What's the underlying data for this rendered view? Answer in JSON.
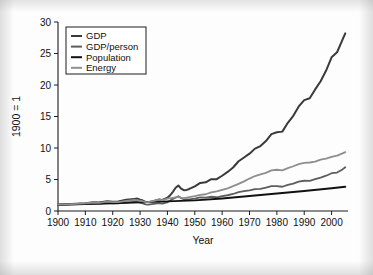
{
  "figure": {
    "background_color": "#fdfdfd",
    "axis_color": "#1c1c1c"
  },
  "chart_data": {
    "type": "line",
    "title": "",
    "subtitle": "",
    "xlabel": "Year",
    "ylabel": "1900 = 1",
    "xlim": [
      1900,
      2006
    ],
    "ylim": [
      0,
      30
    ],
    "xticks": [
      1900,
      1910,
      1920,
      1930,
      1940,
      1950,
      1960,
      1970,
      1980,
      1990,
      2000
    ],
    "xtick_labels": [
      "1900",
      "1910",
      "1920",
      "1930",
      "1940",
      "1950",
      "1960",
      "1970",
      "1980",
      "1990",
      "2000"
    ],
    "yticks": [
      0,
      5,
      10,
      15,
      20,
      25,
      30
    ],
    "ytick_labels": [
      "0",
      "5",
      "10",
      "15",
      "20",
      "25",
      "30"
    ],
    "grid": false,
    "legend_position": "upper-left",
    "legend_entries": [
      "GDP",
      "GDP/person",
      "Population",
      "Energy"
    ],
    "series": [
      {
        "name": "GDP",
        "color": "#3a3a3a",
        "width": 2.0,
        "x": [
          1900,
          1905,
          1910,
          1913,
          1915,
          1918,
          1920,
          1922,
          1925,
          1928,
          1929,
          1930,
          1931,
          1932,
          1933,
          1935,
          1937,
          1938,
          1939,
          1940,
          1941,
          1942,
          1943,
          1944,
          1945,
          1946,
          1947,
          1948,
          1950,
          1952,
          1954,
          1956,
          1958,
          1960,
          1962,
          1964,
          1966,
          1968,
          1970,
          1972,
          1974,
          1976,
          1978,
          1980,
          1982,
          1984,
          1986,
          1988,
          1990,
          1992,
          1994,
          1996,
          1998,
          2000,
          2002,
          2004,
          2005
        ],
        "y": [
          1.0,
          1.12,
          1.25,
          1.38,
          1.34,
          1.55,
          1.48,
          1.52,
          1.78,
          1.92,
          1.97,
          1.8,
          1.66,
          1.44,
          1.41,
          1.6,
          1.82,
          1.74,
          1.9,
          2.1,
          2.5,
          3.05,
          3.7,
          4.05,
          3.55,
          3.3,
          3.35,
          3.5,
          3.9,
          4.45,
          4.55,
          5.05,
          5.05,
          5.6,
          6.2,
          6.9,
          7.9,
          8.5,
          9.1,
          9.9,
          10.3,
          11.1,
          12.2,
          12.5,
          12.6,
          14.0,
          15.1,
          16.6,
          17.6,
          17.9,
          19.3,
          20.6,
          22.3,
          24.4,
          25.2,
          27.2,
          28.2
        ]
      },
      {
        "name": "GDP/person",
        "color": "#5d5d5d",
        "width": 1.8,
        "x": [
          1900,
          1905,
          1910,
          1913,
          1915,
          1918,
          1920,
          1922,
          1925,
          1928,
          1929,
          1930,
          1931,
          1932,
          1933,
          1935,
          1937,
          1938,
          1939,
          1940,
          1942,
          1944,
          1945,
          1946,
          1948,
          1950,
          1952,
          1954,
          1956,
          1958,
          1960,
          1962,
          1964,
          1966,
          1968,
          1970,
          1972,
          1974,
          1976,
          1978,
          1980,
          1982,
          1984,
          1986,
          1988,
          1990,
          1992,
          1994,
          1996,
          1998,
          2000,
          2002,
          2004,
          2005
        ],
        "y": [
          1.0,
          1.05,
          1.12,
          1.2,
          1.14,
          1.28,
          1.2,
          1.22,
          1.36,
          1.44,
          1.46,
          1.32,
          1.2,
          1.04,
          1.01,
          1.12,
          1.25,
          1.18,
          1.27,
          1.38,
          1.9,
          2.35,
          2.05,
          1.86,
          1.84,
          1.95,
          2.15,
          2.12,
          2.26,
          2.18,
          2.35,
          2.5,
          2.7,
          3.0,
          3.15,
          3.28,
          3.48,
          3.52,
          3.7,
          3.95,
          3.95,
          3.85,
          4.15,
          4.35,
          4.65,
          4.8,
          4.78,
          5.05,
          5.3,
          5.6,
          6.0,
          6.1,
          6.6,
          6.95
        ]
      },
      {
        "name": "Population",
        "color": "#111111",
        "width": 1.9,
        "x": [
          1900,
          1910,
          1920,
          1930,
          1940,
          1950,
          1960,
          1970,
          1980,
          1990,
          2000,
          2005
        ],
        "y": [
          1.0,
          1.12,
          1.24,
          1.37,
          1.52,
          1.68,
          1.99,
          2.38,
          2.78,
          3.18,
          3.62,
          3.85
        ]
      },
      {
        "name": "Energy",
        "color": "#8e8e8e",
        "width": 1.8,
        "x": [
          1900,
          1905,
          1910,
          1913,
          1915,
          1918,
          1920,
          1922,
          1925,
          1928,
          1930,
          1932,
          1933,
          1935,
          1937,
          1938,
          1939,
          1940,
          1942,
          1944,
          1945,
          1946,
          1948,
          1950,
          1952,
          1954,
          1956,
          1958,
          1960,
          1962,
          1964,
          1966,
          1968,
          1970,
          1972,
          1974,
          1976,
          1978,
          1980,
          1982,
          1984,
          1986,
          1988,
          1990,
          1992,
          1994,
          1996,
          1998,
          2000,
          2002,
          2004,
          2005
        ],
        "y": [
          1.0,
          1.1,
          1.22,
          1.35,
          1.28,
          1.48,
          1.4,
          1.42,
          1.62,
          1.78,
          1.66,
          1.42,
          1.4,
          1.6,
          1.8,
          1.72,
          1.85,
          1.95,
          2.1,
          2.25,
          2.1,
          2.05,
          2.2,
          2.35,
          2.55,
          2.66,
          2.95,
          3.1,
          3.35,
          3.6,
          3.95,
          4.3,
          4.7,
          5.15,
          5.55,
          5.8,
          6.05,
          6.45,
          6.55,
          6.45,
          6.8,
          7.1,
          7.45,
          7.65,
          7.7,
          7.85,
          8.15,
          8.3,
          8.6,
          8.8,
          9.15,
          9.35
        ]
      }
    ]
  }
}
